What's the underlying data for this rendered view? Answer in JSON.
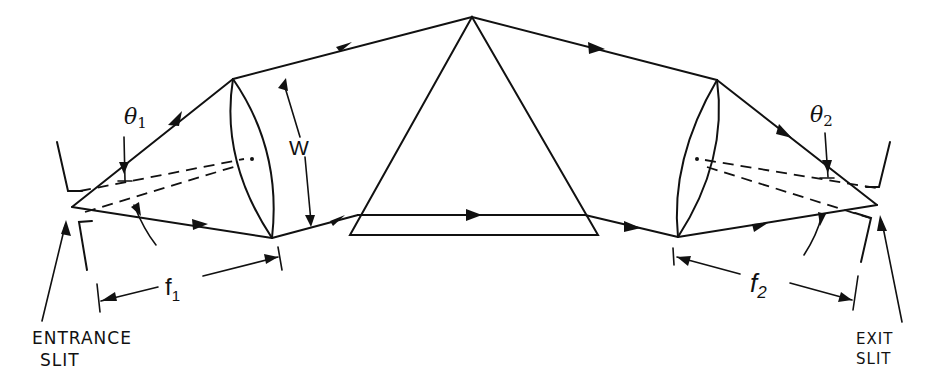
{
  "figure": {
    "type": "prism spectrometer optical diagram",
    "labels": {
      "theta1": "θ",
      "theta1_sub": "1",
      "theta2": "θ",
      "theta2_sub": "2",
      "width": "W",
      "f1": "f",
      "f1_sub": "1",
      "f2": "f",
      "f2_sub": "2",
      "entrance_line1": "ENTRANCE",
      "entrance_line2": "SLIT",
      "exit_line1": "EXIT",
      "exit_line2": "SLIT"
    },
    "components": [
      "entrance slit",
      "collimating lens",
      "prism",
      "focusing lens",
      "exit slit"
    ],
    "colors": {
      "ink": "#111111",
      "background": "#ffffff"
    }
  }
}
